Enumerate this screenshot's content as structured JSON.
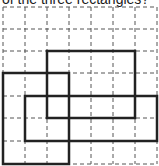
{
  "caption": "of the three rectangles?",
  "grid": {
    "x_lines": [
      3,
      25,
      47,
      69,
      91,
      113,
      135,
      157
    ],
    "y_lines": [
      7,
      29,
      51,
      73,
      96,
      118,
      141,
      164
    ],
    "dash": "4,3",
    "color": "#555555"
  },
  "rectangles": [
    {
      "name": "rectangle-a",
      "x1": 3,
      "y1": 73,
      "x2": 69,
      "y2": 164
    },
    {
      "name": "rectangle-b",
      "x1": 47,
      "y1": 51,
      "x2": 135,
      "y2": 118
    },
    {
      "name": "rectangle-c",
      "x1": 25,
      "y1": 96,
      "x2": 157,
      "y2": 141
    }
  ],
  "stroke_color": "#222222"
}
